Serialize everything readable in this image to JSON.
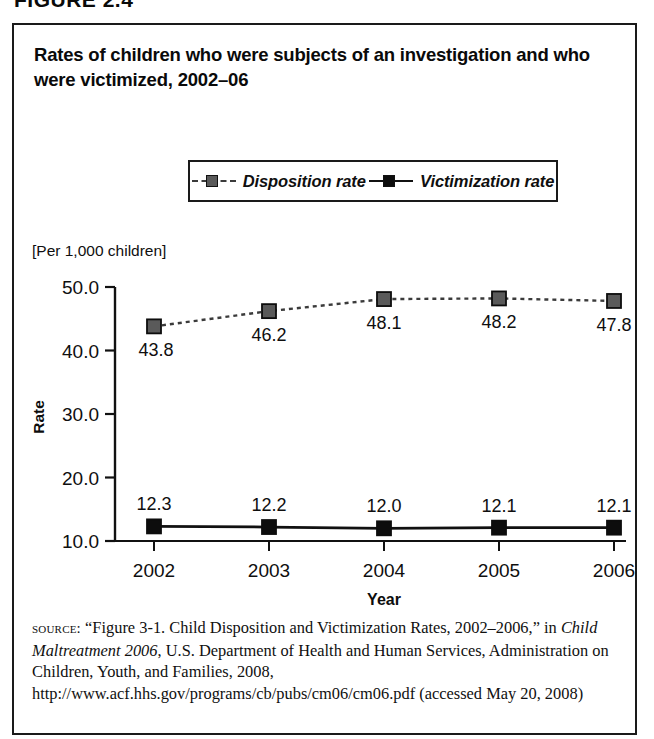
{
  "figure": {
    "number_label": "FIGURE 2.4"
  },
  "chart_title": "Rates of children who were subjects of an investigation and who were victimized, 2002–06",
  "units_caption": "[Per 1,000 children]",
  "legend": {
    "entries": [
      {
        "label": "Disposition rate",
        "style": "dashed",
        "marker_color": "#5a5a5a"
      },
      {
        "label": "Victimization rate",
        "style": "solid",
        "marker_color": "#0d0d0d"
      }
    ]
  },
  "source": {
    "label": "source:",
    "text_part1": " “Figure 3-1. Child Disposition and Victimization Rates, 2002–2006,” in ",
    "italic_title": "Child Maltreatment 2006",
    "text_part2": ", U.S. Department of Health and Human Services, Administration on Children, Youth, and Families, 2008, http://www.acf.hhs.gov/programs/cb/pubs/cm06/cm06.pdf (accessed May 20, 2008)"
  },
  "chart_data": {
    "type": "line",
    "title": "Rates of children who were subjects of an investigation and who were victimized, 2002–06",
    "subtitle": "[Per 1,000 children]",
    "xlabel": "Year",
    "ylabel": "Rate",
    "categories": [
      "2002",
      "2003",
      "2004",
      "2005",
      "2006"
    ],
    "x_tick_labels": [
      "2002",
      "2003",
      "2004",
      "2005",
      "2006"
    ],
    "y_tick_labels": [
      "10.0",
      "20.0",
      "30.0",
      "40.0",
      "50.0"
    ],
    "y_ticks": [
      10.0,
      20.0,
      30.0,
      40.0,
      50.0
    ],
    "ylim": [
      10.0,
      50.0
    ],
    "grid": false,
    "legend_position": "top-center",
    "series": [
      {
        "name": "Disposition rate",
        "values": [
          43.8,
          46.2,
          48.1,
          48.2,
          47.8
        ],
        "labels": [
          "43.8",
          "46.2",
          "48.1",
          "48.2",
          "47.8"
        ],
        "line_style": "dashed",
        "marker": "square",
        "marker_color": "#5a5a5a",
        "line_color": "#3b3b3b"
      },
      {
        "name": "Victimization rate",
        "values": [
          12.3,
          12.2,
          12.0,
          12.1,
          12.1
        ],
        "labels": [
          "12.3",
          "12.2",
          "12.0",
          "12.1",
          "12.1"
        ],
        "line_style": "solid",
        "marker": "square",
        "marker_color": "#0d0d0d",
        "line_color": "#111111"
      }
    ]
  }
}
